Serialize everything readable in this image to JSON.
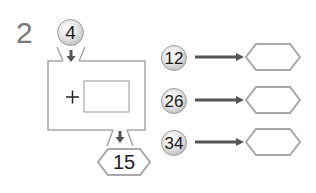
{
  "problem": {
    "number": "2",
    "machine": {
      "input_value": "4",
      "operator": "+",
      "operand_box": "",
      "output_value": "15"
    },
    "rows": [
      {
        "input": "12",
        "output": ""
      },
      {
        "input": "26",
        "output": ""
      },
      {
        "input": "34",
        "output": ""
      }
    ]
  },
  "colors": {
    "line": "#a8a8a8",
    "arrow": "#555555",
    "number_gray": "#7a7a7a"
  }
}
